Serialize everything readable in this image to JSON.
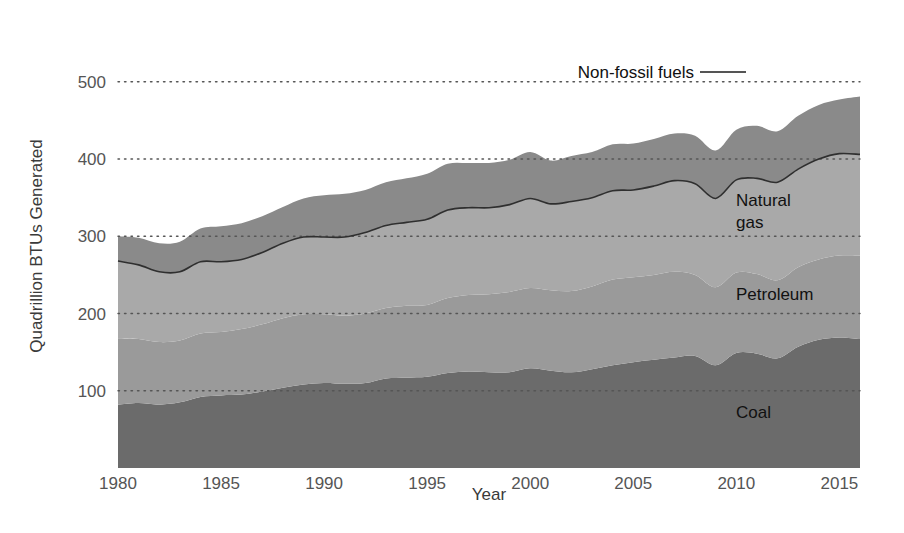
{
  "chart_data": {
    "type": "area",
    "stacked": true,
    "title": "",
    "subtitle": "",
    "xlabel": "Year",
    "ylabel": "Quadrillion BTUs Generated",
    "xlim": [
      1980,
      2016
    ],
    "ylim": [
      0,
      580
    ],
    "xticks": [
      1980,
      1985,
      1990,
      1995,
      2000,
      2005,
      2010,
      2015
    ],
    "yticks": [
      100,
      200,
      300,
      400,
      500
    ],
    "grid": "horizontal-dotted",
    "legend_position": "inline-annotations",
    "x": [
      1980,
      1981,
      1982,
      1983,
      1984,
      1985,
      1986,
      1987,
      1988,
      1989,
      1990,
      1991,
      1992,
      1993,
      1994,
      1995,
      1996,
      1997,
      1998,
      1999,
      2000,
      2001,
      2002,
      2003,
      2004,
      2005,
      2006,
      2007,
      2008,
      2009,
      2010,
      2011,
      2012,
      2013,
      2014,
      2015,
      2016
    ],
    "series": [
      {
        "name": "Coal",
        "color": "#6b6b6b",
        "values": [
          82,
          84,
          82,
          85,
          92,
          94,
          95,
          99,
          104,
          108,
          110,
          109,
          110,
          116,
          117,
          118,
          123,
          125,
          124,
          124,
          129,
          126,
          124,
          128,
          133,
          137,
          140,
          143,
          145,
          133,
          149,
          148,
          142,
          157,
          166,
          169,
          167
        ]
      },
      {
        "name": "Petroleum",
        "color": "#9a9a9a",
        "values": [
          86,
          83,
          81,
          80,
          82,
          82,
          85,
          87,
          90,
          91,
          89,
          88,
          90,
          91,
          93,
          93,
          97,
          99,
          101,
          104,
          104,
          104,
          105,
          107,
          111,
          110,
          110,
          111,
          105,
          101,
          104,
          103,
          101,
          103,
          104,
          106,
          108
        ]
      },
      {
        "name": "Natural gas",
        "color": "#a9a9a9",
        "values": [
          100,
          96,
          91,
          89,
          93,
          91,
          90,
          93,
          97,
          100,
          100,
          102,
          105,
          107,
          108,
          111,
          114,
          113,
          112,
          113,
          116,
          112,
          116,
          115,
          115,
          113,
          115,
          118,
          118,
          115,
          120,
          124,
          127,
          127,
          130,
          132,
          131
        ]
      },
      {
        "name": "Non-fossil fuels",
        "color": "#8a8a8a",
        "values": [
          32,
          35,
          37,
          39,
          43,
          46,
          47,
          47,
          47,
          50,
          54,
          56,
          55,
          56,
          57,
          59,
          60,
          58,
          58,
          58,
          60,
          56,
          59,
          59,
          60,
          60,
          61,
          61,
          62,
          62,
          65,
          68,
          66,
          69,
          70,
          70,
          75
        ]
      }
    ],
    "annotations": [
      {
        "text": "Non-fossil fuels",
        "type": "leader-label",
        "x": 2006,
        "y": 525
      },
      {
        "text": "Natural gas",
        "type": "inline-label",
        "x": 2011,
        "y": 360
      },
      {
        "text": "Petroleum",
        "type": "inline-label",
        "x": 2012,
        "y": 243
      },
      {
        "text": "Coal",
        "type": "inline-label",
        "x": 2011,
        "y": 85
      }
    ]
  },
  "axes": {
    "ylabel": "Quadrillion BTUs Generated",
    "xlabel": "Year",
    "ytick_labels": [
      "100",
      "200",
      "300",
      "400",
      "500"
    ],
    "xtick_labels": [
      "1980",
      "1985",
      "1990",
      "1995",
      "2000",
      "2005",
      "2010",
      "2015"
    ]
  },
  "labels": {
    "non_fossil": "Non-fossil fuels",
    "natural_gas_line1": "Natural",
    "natural_gas_line2": "gas",
    "petroleum": "Petroleum",
    "coal": "Coal"
  },
  "colors": {
    "background": "#ffffff",
    "coal": "#6b6b6b",
    "petroleum": "#9a9a9a",
    "natural_gas": "#a9a9a9",
    "non_fossil": "#8a8a8a",
    "fossil_line": "#2f2f2f",
    "gridline": "#555555",
    "tick_text": "#555555",
    "axis_text": "#3a3a3a"
  }
}
